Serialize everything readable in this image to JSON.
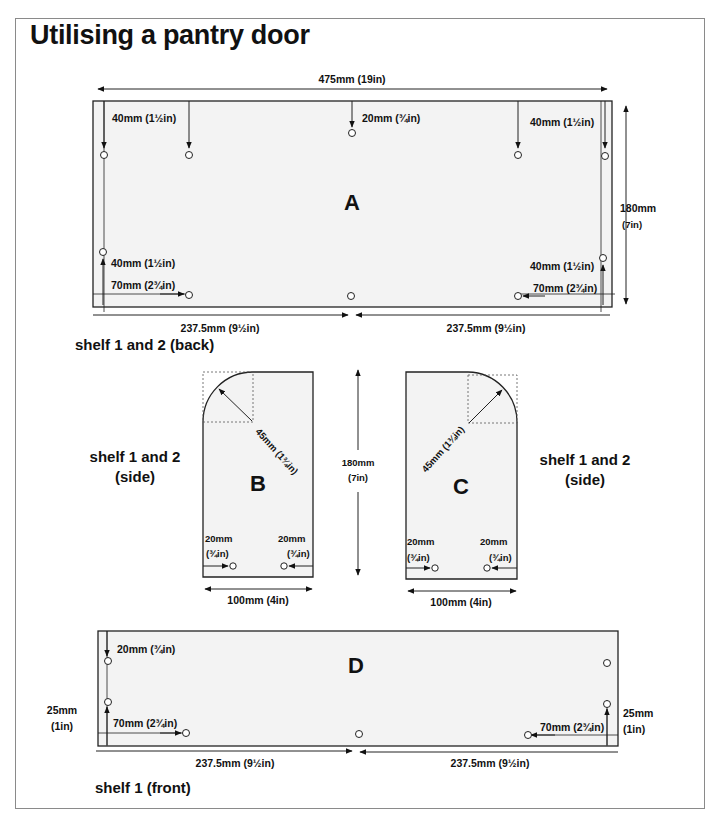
{
  "title": "Utilising a pantry door",
  "colors": {
    "panel_fill": "#f3f3f3",
    "line": "#222222",
    "frame": "#8a8a8a",
    "text": "#111111"
  },
  "panels": {
    "A": {
      "letter": "A",
      "caption": "shelf 1 and 2 (back)",
      "width_label": "475mm (19in)",
      "height_label_mm": "180mm",
      "height_label_in": "(7in)",
      "top_left_edge_label": "40mm (1½in)",
      "top_center_label": "20mm (¾in)",
      "top_right_edge_label": "40mm (1½in)",
      "bottom_left_up_label": "40mm (1½in)",
      "bottom_left_across_label": "70mm (2¾in)",
      "bottom_right_up_label": "40mm (1½in)",
      "bottom_right_across_label": "70mm (2¾in)",
      "half_left_label": "237.5mm (9½in)",
      "half_right_label": "237.5mm (9½in)"
    },
    "B": {
      "letter": "B",
      "caption_line1": "shelf 1 and 2",
      "caption_line2": "(side)",
      "radius_label": "45mm (1¾in)",
      "left_hole_label_mm": "20mm",
      "left_hole_label_in": "(¾in)",
      "right_hole_label_mm": "20mm",
      "right_hole_label_in": "(¾in)",
      "width_label": "100mm (4in)"
    },
    "BC_height": {
      "mm": "180mm",
      "in": "(7in)"
    },
    "C": {
      "letter": "C",
      "caption_line1": "shelf 1 and 2",
      "caption_line2": "(side)",
      "radius_label": "45mm (1¾in)",
      "left_hole_label_mm": "20mm",
      "left_hole_label_in": "(¾in)",
      "right_hole_label_mm": "20mm",
      "right_hole_label_in": "(¾in)",
      "width_label": "100mm (4in)"
    },
    "D": {
      "letter": "D",
      "caption": "shelf 1 (front)",
      "top_left_label": "20mm (¾in)",
      "left_side_mm": "25mm",
      "left_side_in": "(1in)",
      "bottom_left_across_label": "70mm (2¾in)",
      "right_side_mm": "25mm",
      "right_side_in": "(1in)",
      "bottom_right_across_label": "70mm (2¾in)",
      "half_left_label": "237.5mm (9½in)",
      "half_right_label": "237.5mm (9½in)"
    }
  }
}
